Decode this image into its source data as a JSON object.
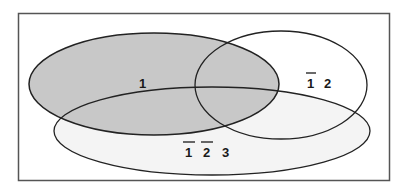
{
  "diagram": {
    "type": "venn",
    "colors": {
      "frame": "#555555",
      "outline": "#222222",
      "set1_fill": "#c8c8c8",
      "set3_fill": "#f4f4f4",
      "background": "#ffffff"
    },
    "regions": {
      "set1_label": "1",
      "set2_only": {
        "neg": "1",
        "pos": "2"
      },
      "set3_only": {
        "neg1": "1",
        "neg2": "2",
        "pos": "3"
      }
    }
  }
}
